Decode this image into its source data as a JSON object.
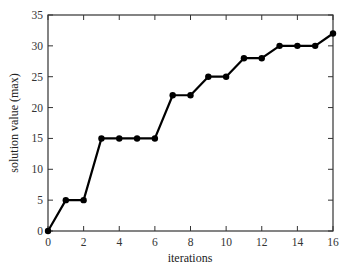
{
  "chart_data": {
    "type": "line",
    "title": "",
    "xlabel": "iterations",
    "ylabel": "solution value (max)",
    "xlim": [
      0,
      16
    ],
    "ylim": [
      0,
      35
    ],
    "x_ticks": [
      0,
      2,
      4,
      6,
      8,
      10,
      12,
      14,
      16
    ],
    "y_ticks": [
      0,
      5,
      10,
      15,
      20,
      25,
      30,
      35
    ],
    "grid": false,
    "legend": null,
    "series": [
      {
        "name": "solution value",
        "x": [
          0,
          1,
          2,
          3,
          4,
          5,
          6,
          7,
          8,
          9,
          10,
          11,
          12,
          13,
          14,
          15,
          16
        ],
        "values": [
          0,
          5,
          5,
          15,
          15,
          15,
          15,
          22,
          22,
          25,
          25,
          28,
          28,
          30,
          30,
          30,
          32
        ],
        "color": "#000000",
        "marker": "circle"
      }
    ]
  }
}
